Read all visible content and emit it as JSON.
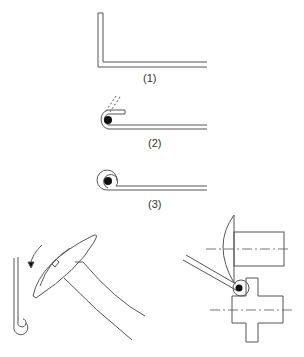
{
  "diagram": {
    "colors": {
      "stroke": "#555555",
      "fill_dot": "#111111",
      "background": "#ffffff"
    },
    "steps": [
      {
        "id": "step-1",
        "label": "(1)",
        "description": "Sheet bent at right angle (L flange)"
      },
      {
        "id": "step-2",
        "label": "(2)",
        "description": "Flange curled over wire core, original position dashed"
      },
      {
        "id": "step-3",
        "label": "(3)",
        "description": "Edge fully rolled around wire core"
      }
    ],
    "illustrations": [
      {
        "id": "hammer-method",
        "description": "Hammer peening curl with arrow showing direction of blow"
      },
      {
        "id": "roller-method",
        "description": "Rolling dies with centerlines forming curl on inclined sheet"
      }
    ]
  }
}
